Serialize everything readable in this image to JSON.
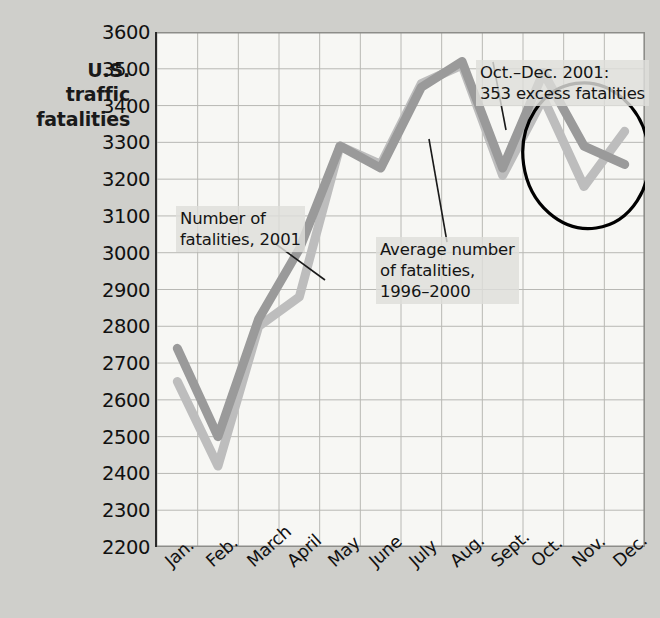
{
  "axis_title": "U.S.\ntraffic\nfatalities",
  "annotations": {
    "series_2001": "Number of\nfatalities, 2001",
    "series_avg": "Average number\nof fatalities,\n1996–2000",
    "excess": "Oct.–Dec. 2001:\n353 excess fatalities"
  },
  "colors": {
    "series_2001": "#9a9a9a",
    "series_avg": "#bdbdbd",
    "plot_background": "#f7f7f4",
    "page_background": "#cfcfcb",
    "axis": "#2a2a2a",
    "circle": "#000000",
    "gridline": "#b8b8b4"
  },
  "chart_data": {
    "type": "line",
    "title": "",
    "xlabel": "",
    "ylabel": "U.S. traffic fatalities",
    "categories": [
      "Jan.",
      "Feb.",
      "March",
      "April",
      "May",
      "June",
      "July",
      "Aug.",
      "Sept.",
      "Oct.",
      "Nov.",
      "Dec."
    ],
    "ylim": [
      2200,
      3600
    ],
    "ytick_values": [
      3600,
      3500,
      3400,
      3300,
      3200,
      3100,
      3000,
      2900,
      2800,
      2700,
      2600,
      2500,
      2400,
      2300,
      2200
    ],
    "ytick_labels": [
      "3600",
      "3500",
      "3400",
      "3300",
      "3200",
      "3100",
      "3000",
      "2900",
      "2800",
      "2700",
      "2600",
      "2500",
      "2400",
      "2300",
      "2200"
    ],
    "grid": true,
    "legend": "annotations",
    "series": [
      {
        "name": "Number of fatalities, 2001",
        "color": "#9a9a9a",
        "values": [
          2740,
          2500,
          2820,
          3010,
          3290,
          3230,
          3450,
          3520,
          3230,
          3490,
          3290,
          3240
        ]
      },
      {
        "name": "Average number of fatalities, 1996-2000",
        "color": "#bdbdbd",
        "values": [
          2650,
          2420,
          2800,
          2880,
          3290,
          3240,
          3460,
          3510,
          3210,
          3420,
          3180,
          3330
        ]
      }
    ],
    "annotations": [
      {
        "text": "Number of fatalities, 2001",
        "target": "March-April segment of 2001 series"
      },
      {
        "text": "Average number of fatalities, 1996-2000",
        "target": "July-Aug segment of average series"
      },
      {
        "text": "Oct.-Dec. 2001: 353 excess fatalities",
        "target": "circled Oct-Dec region"
      }
    ],
    "highlight": {
      "shape": "ellipse",
      "label": "Oct.–Dec. 2001: 353 excess fatalities",
      "excess_fatalities": 353,
      "period": "Oct.–Dec. 2001"
    }
  }
}
